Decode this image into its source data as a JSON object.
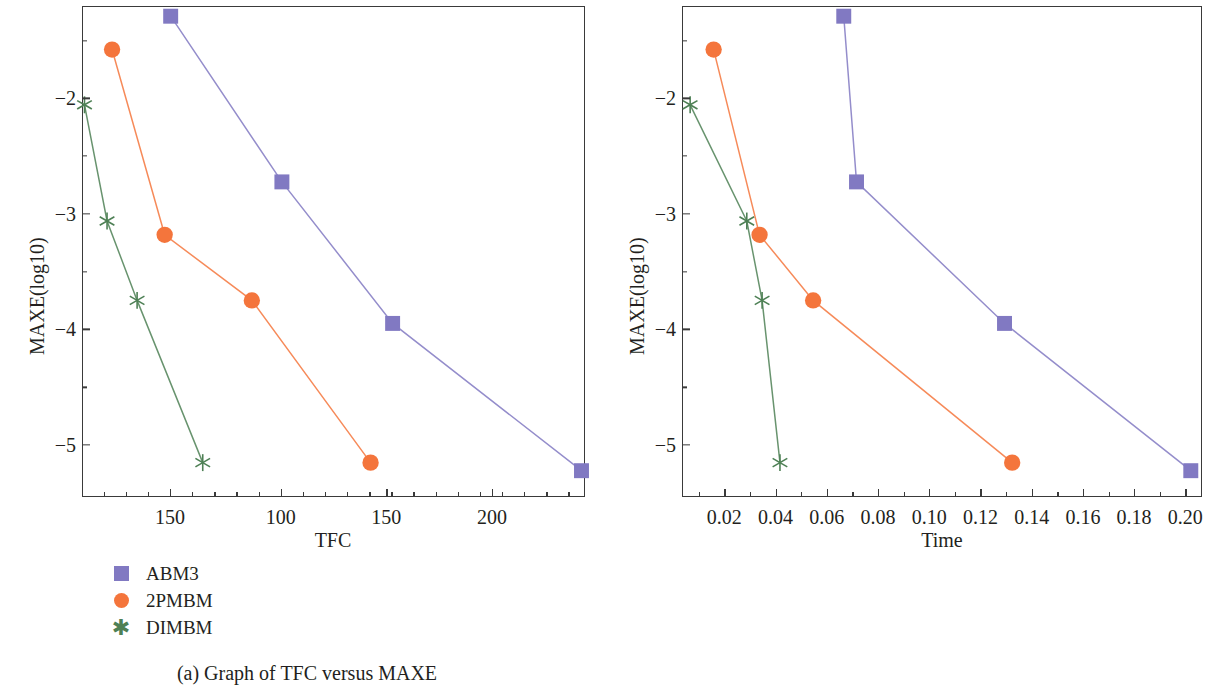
{
  "figure": {
    "panels": [
      {
        "id": "a",
        "caption": "(a)  Graph of TFC versus MAXE",
        "xlabel": "TFC",
        "ylabel": "MAXE(log10)"
      },
      {
        "id": "b",
        "caption": "(b)  Graph of time versus MAXE",
        "xlabel": "Time",
        "ylabel": "MAXE(log10)"
      }
    ],
    "legend": {
      "entries": [
        {
          "label": "ABM3",
          "marker": "square-marker",
          "color": "#8179c2"
        },
        {
          "label": "2PMBM",
          "marker": "circle-marker",
          "color": "#f4753c"
        },
        {
          "label": "DIMBM",
          "marker": "star-marker",
          "color": "#4e8055"
        }
      ]
    }
  },
  "chart_data": [
    {
      "type": "line",
      "title": "(a)  Graph of TFC versus MAXE",
      "xlabel": "TFC",
      "ylabel": "MAXE(log10)",
      "xticks": [
        "150",
        "100",
        "150",
        "200"
      ],
      "xtick_positions": [
        0.175,
        0.395,
        0.605,
        0.815
      ],
      "x_minor_count": 5,
      "yticks": [
        "-2",
        "-3",
        "-4",
        "-5"
      ],
      "ylim": [
        -5.45,
        -1.2
      ],
      "xlim": [
        0,
        1
      ],
      "grid": false,
      "legend_position": "below-left",
      "series": [
        {
          "name": "ABM3",
          "color": "#8179c2",
          "marker": "square",
          "points": [
            {
              "x": 0.175,
              "y": -1.28
            },
            {
              "x": 0.397,
              "y": -2.72
            },
            {
              "x": 0.618,
              "y": -3.95
            },
            {
              "x": 0.995,
              "y": -5.23
            }
          ]
        },
        {
          "name": "2PMBM",
          "color": "#f4753c",
          "marker": "circle",
          "points": [
            {
              "x": 0.058,
              "y": -1.57
            },
            {
              "x": 0.163,
              "y": -3.18
            },
            {
              "x": 0.337,
              "y": -3.75
            },
            {
              "x": 0.574,
              "y": -5.16
            }
          ]
        },
        {
          "name": "DIMBM",
          "color": "#4e8055",
          "marker": "star",
          "points": [
            {
              "x": 0.003,
              "y": -2.05
            },
            {
              "x": 0.048,
              "y": -3.06
            },
            {
              "x": 0.108,
              "y": -3.75
            },
            {
              "x": 0.239,
              "y": -5.16
            }
          ]
        }
      ]
    },
    {
      "type": "line",
      "title": "(b)  Graph of time versus MAXE",
      "xlabel": "Time",
      "ylabel": "MAXE(log10)",
      "xticks": [
        "0.02",
        "0.04",
        "0.06",
        "0.08",
        "0.10",
        "0.12",
        "0.14",
        "0.16",
        "0.18",
        "0.20"
      ],
      "xlim": [
        0.0035,
        0.2065
      ],
      "x_minor_count": 2,
      "yticks": [
        "-2",
        "-3",
        "-4",
        "-5"
      ],
      "ylim": [
        -5.45,
        -1.2
      ],
      "grid": false,
      "legend_position": "below-left",
      "series": [
        {
          "name": "ABM3",
          "color": "#8179c2",
          "marker": "square",
          "points": [
            {
              "x": 0.0665,
              "y": -1.28
            },
            {
              "x": 0.0715,
              "y": -2.72
            },
            {
              "x": 0.1295,
              "y": -3.95
            },
            {
              "x": 0.2025,
              "y": -5.23
            }
          ]
        },
        {
          "name": "2PMBM",
          "color": "#f4753c",
          "marker": "circle",
          "points": [
            {
              "x": 0.0155,
              "y": -1.57
            },
            {
              "x": 0.0335,
              "y": -3.18
            },
            {
              "x": 0.0545,
              "y": -3.75
            },
            {
              "x": 0.1325,
              "y": -5.16
            }
          ]
        },
        {
          "name": "DIMBM",
          "color": "#4e8055",
          "marker": "star",
          "points": [
            {
              "x": 0.0063,
              "y": -2.05
            },
            {
              "x": 0.0285,
              "y": -3.06
            },
            {
              "x": 0.0345,
              "y": -3.75
            },
            {
              "x": 0.0415,
              "y": -5.16
            }
          ]
        }
      ]
    }
  ]
}
